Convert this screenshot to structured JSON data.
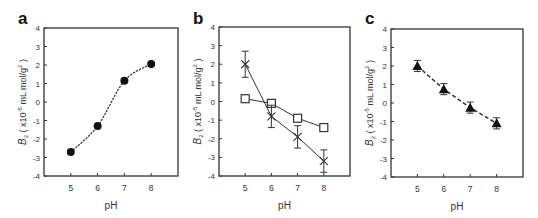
{
  "figure": {
    "panels": [
      {
        "id": "a",
        "letter": "a"
      },
      {
        "id": "b",
        "letter": "b"
      },
      {
        "id": "c",
        "letter": "c"
      }
    ],
    "ylabel_main": "B",
    "ylabel_sub": "2",
    "ylabel_rest": " ( x10",
    "ylabel_exp": "-5",
    "ylabel_unit": " mL mol/g",
    "ylabel_unit_exp": "2",
    "ylabel_close": " )",
    "xlabel": "pH"
  },
  "chart_data": [
    {
      "panel": "a",
      "type": "scatter",
      "title": "",
      "xlabel": "pH",
      "ylabel": "B2 ( x10^-5 mL mol/g^2 )",
      "xlim": [
        4,
        9
      ],
      "ylim": [
        -4,
        4
      ],
      "xticks": [
        5,
        6,
        7,
        8
      ],
      "yticks": [
        -4,
        -3,
        -2,
        -1,
        0,
        1,
        2,
        3,
        4
      ],
      "grid": false,
      "series": [
        {
          "name": "filled circles",
          "marker": "circle-filled",
          "line": "dotted-curve",
          "x": [
            5,
            6,
            7,
            8
          ],
          "values": [
            -2.7,
            -1.3,
            1.15,
            2.05
          ],
          "errors": [
            0,
            0,
            0,
            0
          ]
        }
      ]
    },
    {
      "panel": "b",
      "type": "line",
      "title": "",
      "xlabel": "pH",
      "ylabel": "B2 ( x10^-5 mL mol/g^2 )",
      "xlim": [
        4,
        9
      ],
      "ylim": [
        -4,
        4
      ],
      "xticks": [
        5,
        6,
        7,
        8
      ],
      "yticks": [
        -4,
        -3,
        -2,
        -1,
        0,
        1,
        2,
        3,
        4
      ],
      "grid": false,
      "series": [
        {
          "name": "open squares",
          "marker": "square-open",
          "line": "solid",
          "x": [
            5,
            6,
            7,
            8
          ],
          "values": [
            0.15,
            -0.1,
            -0.9,
            -1.4
          ],
          "errors": [
            0.1,
            0.1,
            0.1,
            0.1
          ]
        },
        {
          "name": "crosses",
          "marker": "x",
          "line": "solid",
          "x": [
            5,
            6,
            7,
            8
          ],
          "values": [
            2.0,
            -0.8,
            -1.9,
            -3.2
          ],
          "errors": [
            0.7,
            0.6,
            0.6,
            0.6
          ]
        }
      ]
    },
    {
      "panel": "c",
      "type": "line",
      "title": "",
      "xlabel": "pH",
      "ylabel": "B2 ( x10^-5 mL mol/g^2 )",
      "xlim": [
        4,
        9
      ],
      "ylim": [
        -4,
        4
      ],
      "xticks": [
        5,
        6,
        7,
        8
      ],
      "yticks": [
        -4,
        -3,
        -2,
        -1,
        0,
        1,
        2,
        3,
        4
      ],
      "grid": false,
      "series": [
        {
          "name": "filled triangles",
          "marker": "triangle-filled",
          "line": "dashed",
          "x": [
            5,
            6,
            7,
            8
          ],
          "values": [
            2.0,
            0.75,
            -0.25,
            -1.1
          ],
          "errors": [
            0.3,
            0.3,
            0.3,
            0.3
          ]
        }
      ]
    }
  ]
}
